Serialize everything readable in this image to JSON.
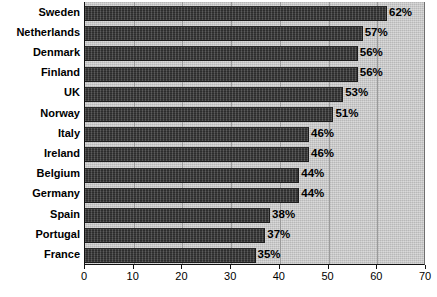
{
  "chart_data": {
    "type": "bar",
    "orientation": "horizontal",
    "title": "",
    "xlabel": "",
    "ylabel": "",
    "xlim": [
      0,
      70
    ],
    "xticks": [
      0,
      10,
      20,
      30,
      40,
      50,
      60,
      70
    ],
    "xtick_labels": [
      "0",
      "10",
      "20",
      "30",
      "40",
      "50",
      "60",
      "70"
    ],
    "grid": "vertical",
    "legend": "none",
    "value_suffix": "%",
    "categories": [
      "Sweden",
      "Netherlands",
      "Denmark",
      "Finland",
      "UK",
      "Norway",
      "Italy",
      "Ireland",
      "Belgium",
      "Germany",
      "Spain",
      "Portugal",
      "France"
    ],
    "values": [
      62,
      57,
      56,
      56,
      53,
      51,
      46,
      46,
      44,
      44,
      38,
      37,
      35
    ],
    "data_labels": [
      "62%",
      "57%",
      "56%",
      "56%",
      "53%",
      "51%",
      "46%",
      "46%",
      "44%",
      "44%",
      "38%",
      "37%",
      "35%"
    ],
    "colors": {
      "bar": "#3c3c3c",
      "plot_background": "#c9c9c9",
      "gridline": "#9a9a9a",
      "axis": "#111111",
      "text": "#000000",
      "page_background": "#ffffff"
    }
  },
  "caption": {
    "text": ""
  }
}
